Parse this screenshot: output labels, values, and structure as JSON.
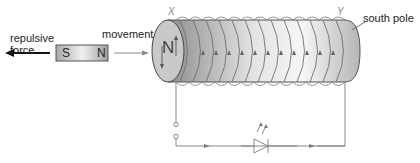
{
  "labels": {
    "repulsive_force": [
      "repulsive",
      "force"
    ],
    "movement": "movement",
    "south_pole": "south pole",
    "x_end": "X",
    "y_end": "Y"
  },
  "magnet": {
    "south": "S",
    "north": "N"
  },
  "coil_face": {
    "pole": "N"
  },
  "colors": {
    "line": "#6e6e6e",
    "force_arrow": "#111111",
    "coil_dark": "#9a9a9a",
    "coil_light": "#f2f2f2"
  }
}
